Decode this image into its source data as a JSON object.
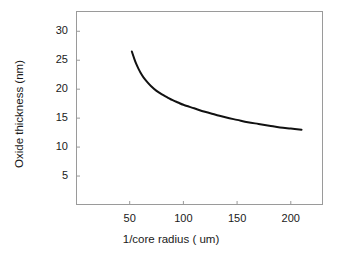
{
  "chart_data": {
    "type": "line",
    "title": "",
    "xlabel": "1/core radius ( um)",
    "ylabel": "Oxide thickness (nm)",
    "xlim": [
      0,
      230
    ],
    "ylim": [
      0,
      33.5
    ],
    "xticks": [
      50,
      100,
      150,
      200
    ],
    "xtick_labels": [
      "50",
      "100",
      "150",
      "200"
    ],
    "yticks": [
      5,
      10,
      15,
      20,
      25,
      30
    ],
    "ytick_labels": [
      "5",
      "10",
      "15",
      "20",
      "25",
      "30"
    ],
    "grid": false,
    "legend": null,
    "series": [
      {
        "name": "oxide thickness vs 1/core radius",
        "color": "#111111",
        "linewidth": 2,
        "x": [
          52,
          54,
          56,
          58,
          60,
          63,
          66,
          70,
          75,
          80,
          85,
          90,
          95,
          100,
          110,
          120,
          130,
          140,
          150,
          160,
          170,
          180,
          190,
          200,
          210
        ],
        "y": [
          26.5,
          25.4,
          24.4,
          23.6,
          22.9,
          22.0,
          21.3,
          20.5,
          19.7,
          19.1,
          18.6,
          18.1,
          17.7,
          17.3,
          16.7,
          16.1,
          15.6,
          15.1,
          14.7,
          14.3,
          14.0,
          13.7,
          13.4,
          13.2,
          13.0
        ]
      }
    ],
    "annotations": []
  },
  "axes": {
    "xlabel_text": "1/core radius ( um)",
    "ylabel_text": "Oxide thickness (nm)"
  },
  "style": {
    "background": "#ffffff",
    "frame_color": "#9a9a9a",
    "curve_color": "#111111",
    "text_color": "#1a1a1a"
  }
}
